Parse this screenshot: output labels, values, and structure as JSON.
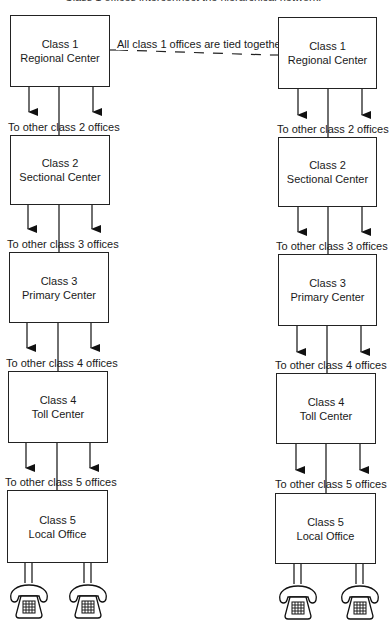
{
  "diagram": {
    "top_caption_cut": "Class 1 offices interconnect the hierarchical network.",
    "tie_label": "All class 1 offices are tied together.",
    "columns": [
      {
        "offices": [
          {
            "class": "Class 1",
            "name": "Regional Center"
          },
          {
            "class": "Class 2",
            "name": "Sectional Center"
          },
          {
            "class": "Class 3",
            "name": "Primary Center"
          },
          {
            "class": "Class 4",
            "name": "Toll Center"
          },
          {
            "class": "Class 5",
            "name": "Local Office"
          }
        ],
        "branch_labels": [
          "To other class 2 offices",
          "To other class 3 offices",
          "To other class 4 offices",
          "To other class 5 offices"
        ]
      },
      {
        "offices": [
          {
            "class": "Class 1",
            "name": "Regional Center"
          },
          {
            "class": "Class 2",
            "name": "Sectional Center"
          },
          {
            "class": "Class 3",
            "name": "Primary Center"
          },
          {
            "class": "Class 4",
            "name": "Toll Center"
          },
          {
            "class": "Class 5",
            "name": "Local Office"
          }
        ],
        "branch_labels": [
          "To other class 2 offices",
          "To other class 3 offices",
          "To other class 4 offices",
          "To other class 5 offices"
        ]
      }
    ],
    "terminals": [
      "telephone-icon",
      "telephone-icon",
      "telephone-icon",
      "telephone-icon"
    ],
    "colors": {
      "line": "#222222",
      "background": "#ffffff"
    }
  }
}
